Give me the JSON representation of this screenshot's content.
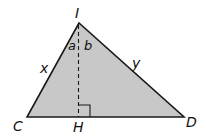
{
  "diagram": {
    "type": "triangle-with-altitude",
    "fill_color": "#c8c8c8",
    "stroke_color": "#1a1a1a",
    "vertices": {
      "I": {
        "label": "I",
        "x": 79,
        "y": 23
      },
      "C": {
        "label": "C",
        "x": 27,
        "y": 117
      },
      "D": {
        "label": "D",
        "x": 184,
        "y": 117
      },
      "H": {
        "label": "H",
        "x": 78,
        "y": 117
      }
    },
    "segments": [
      {
        "from": "I",
        "to": "C",
        "label": "x"
      },
      {
        "from": "I",
        "to": "D",
        "label": "y"
      },
      {
        "from": "C",
        "to": "D",
        "label": ""
      },
      {
        "from": "I",
        "to": "H",
        "label": "",
        "style": "dashed",
        "role": "altitude"
      }
    ],
    "angles": [
      {
        "vertex": "I",
        "label": "a",
        "between": [
          "C",
          "H"
        ]
      },
      {
        "vertex": "I",
        "label": "b",
        "between": [
          "H",
          "D"
        ]
      },
      {
        "vertex": "H",
        "label": "",
        "marker": "right-angle"
      }
    ],
    "labels": {
      "I": "I",
      "C": "C",
      "D": "D",
      "H": "H",
      "x": "x",
      "y": "y",
      "a": "a",
      "b": "b"
    }
  }
}
